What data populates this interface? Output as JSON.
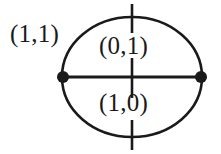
{
  "figure": {
    "kind": "graph-diagram",
    "background_color": "#ffffff",
    "stroke_color": "#1a1a1a",
    "labels": {
      "outer": "(1,1)",
      "upper_region": "(0,1)",
      "lower_region": "(1,0)"
    },
    "geometry": {
      "circle": {
        "center_x": 132,
        "center_y": 77,
        "radius_x": 70,
        "radius_y": 60,
        "stroke_width": 2.6
      },
      "chord": {
        "x1": 62,
        "y1": 77,
        "x2": 202,
        "y2": 77,
        "stroke_width": 3.2
      },
      "vertices": [
        {
          "name": "left-vertex",
          "cx": 63,
          "cy": 77,
          "r": 6.0
        },
        {
          "name": "right-vertex",
          "cx": 201,
          "cy": 77,
          "r": 6.0
        }
      ],
      "ticks": [
        {
          "name": "top-tick",
          "x": 132,
          "y1": 4,
          "y2": 33,
          "stroke_width": 2.6
        },
        {
          "name": "center-tick",
          "x": 132,
          "y1": 58,
          "y2": 98,
          "stroke_width": 2.6
        },
        {
          "name": "bottom-tick",
          "x": 132,
          "y1": 120,
          "y2": 150,
          "stroke_width": 2.6
        }
      ]
    }
  }
}
